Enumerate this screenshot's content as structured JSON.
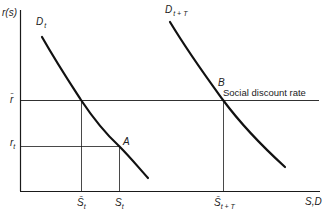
{
  "diagram": {
    "type": "economics supply-demand diagram",
    "axes": {
      "y_label": "r(s)",
      "x_label": "S,D"
    },
    "curves": [
      {
        "id": "D_t",
        "label_main": "D",
        "label_sub": "t"
      },
      {
        "id": "D_t+T",
        "label_main": "D",
        "label_sub": "t + T"
      }
    ],
    "points": [
      {
        "id": "A",
        "label": "A"
      },
      {
        "id": "B",
        "label": "B"
      }
    ],
    "y_ticks": [
      {
        "id": "r_bar",
        "label": "r̄"
      },
      {
        "id": "r_t",
        "label_main": "r",
        "label_sub": "t"
      }
    ],
    "x_ticks": [
      {
        "id": "S_bar_t",
        "label_main": "S̄",
        "label_sub": "t"
      },
      {
        "id": "S_t",
        "label_main": "S",
        "label_sub": "t"
      },
      {
        "id": "S_bar_t+T",
        "label_main": "S̄",
        "label_sub": "t + T"
      }
    ],
    "annotations": {
      "social_discount_rate": "Social discount rate"
    },
    "colors": {
      "line": "#1a1a1a",
      "background": "#ffffff"
    }
  }
}
